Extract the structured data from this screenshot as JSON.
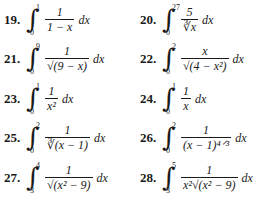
{
  "problems": [
    {
      "number": "19.",
      "upper": "1",
      "lower": "0",
      "numerator": "1",
      "denominator": "1 − x",
      "differential": "dx"
    },
    {
      "number": "20.",
      "upper": "27",
      "lower": "0",
      "numerator": "5",
      "denominator": "∛x",
      "differential": "dx"
    },
    {
      "number": "21.",
      "upper": "9",
      "lower": "0",
      "numerator": "1",
      "denominator": "√(9 − x)",
      "differential": "dx"
    },
    {
      "number": "22.",
      "upper": "2",
      "lower": "0",
      "numerator": "x",
      "denominator": "√(4 − x²)",
      "differential": "dx"
    },
    {
      "number": "23.",
      "upper": "1",
      "lower": "0",
      "numerator": "1",
      "denominator": "x²",
      "differential": "dx"
    },
    {
      "number": "24.",
      "upper": "1",
      "lower": "0",
      "numerator": "1",
      "denominator": "x",
      "differential": "dx"
    },
    {
      "number": "25.",
      "upper": "2",
      "lower": "0",
      "numerator": "1",
      "denominator": "∛(x − 1)",
      "differential": "dx"
    },
    {
      "number": "26.",
      "upper": "2",
      "lower": "0",
      "numerator": "1",
      "denominator": "(x − 1)⁴ᐟ³",
      "differential": "dx"
    },
    {
      "number": "27.",
      "upper": "4",
      "lower": "3",
      "numerator": "1",
      "denominator": "√(x² − 9)",
      "differential": "dx"
    },
    {
      "number": "28.",
      "upper": "5",
      "lower": "3",
      "numerator": "1",
      "denominator": "x²√(x² − 9)",
      "differential": "dx"
    }
  ]
}
